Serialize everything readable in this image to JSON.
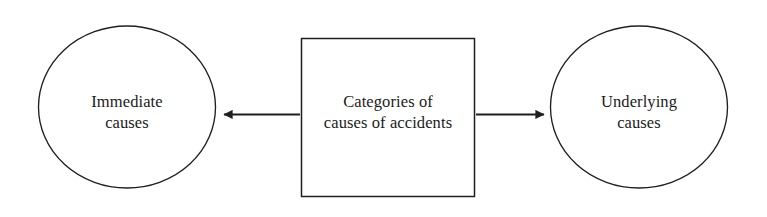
{
  "diagram": {
    "type": "flow-diagram",
    "title": "Categories of causes of accidents",
    "background_color": "#ffffff",
    "stroke_color": "#1f1f1f",
    "text_color": "#1b1b1b",
    "nodes": [
      {
        "id": "immediate-causes",
        "shape": "ellipse",
        "label": "Immediate\ncauses",
        "line1": "Immediate",
        "line2": "causes"
      },
      {
        "id": "categories-of-causes",
        "shape": "rectangle",
        "label": "Categories of\ncauses of accidents",
        "line1": "Categories of",
        "line2": "causes of accidents"
      },
      {
        "id": "underlying-causes",
        "shape": "ellipse",
        "label": "Underlying\ncauses",
        "line1": "Underlying",
        "line2": "causes"
      }
    ],
    "edges": [
      {
        "id": "edge-to-immediate",
        "from": "categories-of-causes",
        "to": "immediate-causes",
        "direction": "left",
        "arrowhead": "solid-triangle",
        "label": ""
      },
      {
        "id": "edge-to-underlying",
        "from": "categories-of-causes",
        "to": "underlying-causes",
        "direction": "right",
        "arrowhead": "solid-triangle",
        "label": ""
      }
    ]
  }
}
